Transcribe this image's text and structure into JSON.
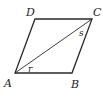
{
  "diagram": {
    "shape": "parallelogram",
    "vertices": [
      {
        "name": "A",
        "x": 15,
        "y": 73,
        "label_x": 4,
        "label_y": 87
      },
      {
        "name": "B",
        "x": 72,
        "y": 73,
        "label_x": 71,
        "label_y": 88
      },
      {
        "name": "C",
        "x": 92,
        "y": 19,
        "label_x": 93,
        "label_y": 16
      },
      {
        "name": "D",
        "x": 35,
        "y": 19,
        "label_x": 26,
        "label_y": 16
      }
    ],
    "diagonal": {
      "from": "A",
      "to": "C"
    },
    "angles": [
      {
        "label": "r",
        "at": "A",
        "x": 28,
        "y": 72
      },
      {
        "label": "s",
        "at": "C",
        "x": 79,
        "y": 36
      }
    ],
    "colors": {
      "stroke": "#2a2a2a",
      "text": "#222222",
      "background": "#ffffff"
    }
  }
}
